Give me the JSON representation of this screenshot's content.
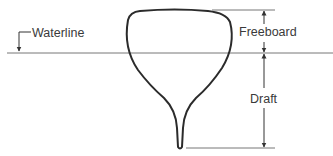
{
  "diagram": {
    "type": "ship hull cross-section",
    "labels": {
      "waterline": "Waterline",
      "freeboard": "Freeboard",
      "draft": "Draft"
    },
    "colors": {
      "hull_stroke": "#2b2b2b",
      "dimension_lines": "#555555",
      "text": "#3a3a3a",
      "background": "#ffffff"
    }
  }
}
